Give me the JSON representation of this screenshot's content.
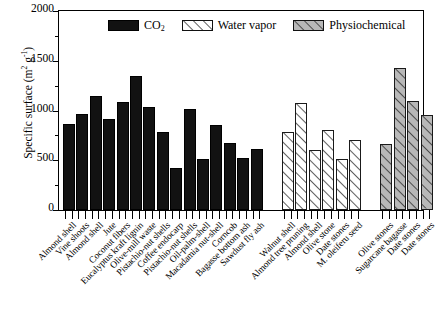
{
  "chart_data": {
    "type": "bar",
    "title": "",
    "xlabel": "",
    "ylabel": "Specific surface (m2 g-1)",
    "ylabel_display": "Specific surface (m",
    "ylim": [
      0,
      2000
    ],
    "yticks": [
      0,
      500,
      1000,
      1500,
      2000
    ],
    "ytick_labels": [
      "0",
      "500",
      "1000",
      "1500",
      "2000"
    ],
    "y_minor_ticks": [
      250,
      750,
      1250,
      1750
    ],
    "grid": false,
    "legend_position": "top-center",
    "legend": [
      {
        "label": "CO2",
        "label_main": "CO",
        "label_sub": "2",
        "key": "co2",
        "fill": "#121212",
        "hatch": false
      },
      {
        "label": "Water vapor",
        "key": "wv",
        "fill": "#ffffff",
        "hatch": true
      },
      {
        "label": "Physiochemical",
        "key": "pc",
        "fill": "#b8b8b8",
        "hatch": true
      }
    ],
    "categories": [
      "Almond shell",
      "Vine shoots",
      "Almond shell",
      "Jute",
      "Coconut fibers",
      "Eucalyptus kraft lignin",
      "Olive-mill waste",
      "Pistachio-nut shells",
      "Coffee endocarp",
      "Pistachio-nut shells",
      "Oil-palm-shell",
      "Macadamia nut-shell",
      "Corncob",
      "Bagasse bottom ash",
      "Sawdust fly ash",
      "Walnut shell",
      "Almond tree pruning",
      "Almond shell",
      "Olive stone",
      "Date stones",
      "M. oleiferu seed",
      "Olive stones",
      "Sugarcane bagasse",
      "Date stones",
      "Date stones"
    ],
    "series": [
      {
        "name": "CO2",
        "key": "co2",
        "values": [
          860,
          960,
          1145,
          915,
          1085,
          1345,
          1040,
          780,
          420,
          1015,
          515,
          850,
          675,
          520,
          610,
          null,
          null,
          null,
          null,
          null,
          null,
          null,
          null,
          null,
          null
        ]
      },
      {
        "name": "Water vapor",
        "key": "wv",
        "values": [
          null,
          null,
          null,
          null,
          null,
          null,
          null,
          null,
          null,
          null,
          null,
          null,
          null,
          null,
          null,
          785,
          1075,
          600,
          805,
          510,
          705,
          null,
          null,
          null,
          null
        ]
      },
      {
        "name": "Physiochemical",
        "key": "pc",
        "values": [
          null,
          null,
          null,
          null,
          null,
          null,
          null,
          null,
          null,
          null,
          null,
          null,
          null,
          null,
          null,
          null,
          null,
          null,
          null,
          null,
          null,
          665,
          1430,
          1095,
          950
        ]
      }
    ]
  },
  "axis": {
    "y_title_prefix": "Specific surface (m",
    "y_title_sup1": "2",
    "y_title_mid": " g",
    "y_title_sup2": "-1",
    "y_title_suffix": ")"
  }
}
